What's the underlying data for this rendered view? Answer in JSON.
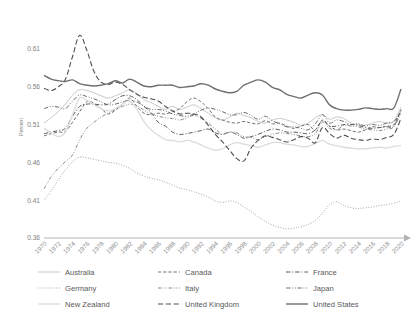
{
  "chart_data": {
    "type": "line",
    "title": "",
    "xlabel": "",
    "ylabel": "Percent",
    "ylim": [
      0.36,
      0.635
    ],
    "xlim": [
      1970,
      2020
    ],
    "grid": false,
    "legend_position": "bottom",
    "yticks": [
      "0.36",
      "0.41",
      "0.46",
      "0.51",
      "0.56",
      "0.61"
    ],
    "ytick_values": [
      0.36,
      0.41,
      0.46,
      0.51,
      0.56,
      0.61
    ],
    "xticks": [
      "1970",
      "1972",
      "1974",
      "1976",
      "1978",
      "1980",
      "1982",
      "1984",
      "1986",
      "1988",
      "1990",
      "1992",
      "1994",
      "1996",
      "1998",
      "2000",
      "2002",
      "2004",
      "2006",
      "2008",
      "2010",
      "2012",
      "2014",
      "2016",
      "2018",
      "2020"
    ],
    "x": [
      1970,
      1971,
      1972,
      1973,
      1974,
      1975,
      1976,
      1977,
      1978,
      1979,
      1980,
      1981,
      1982,
      1983,
      1984,
      1985,
      1986,
      1987,
      1988,
      1989,
      1990,
      1991,
      1992,
      1993,
      1994,
      1995,
      1996,
      1997,
      1998,
      1999,
      2000,
      2001,
      2002,
      2003,
      2004,
      2005,
      2006,
      2007,
      2008,
      2009,
      2010,
      2011,
      2012,
      2013,
      2014,
      2015,
      2016,
      2017,
      2018,
      2019,
      2020
    ],
    "series": [
      {
        "name": "Australia",
        "style": "solid",
        "color": "#c9c9c9",
        "width": 1.0,
        "values": [
          0.512,
          0.519,
          0.527,
          0.537,
          0.549,
          0.556,
          0.555,
          0.552,
          0.548,
          0.545,
          0.548,
          0.552,
          0.556,
          0.551,
          0.543,
          0.539,
          0.534,
          0.53,
          0.534,
          0.53,
          0.533,
          0.536,
          0.531,
          0.525,
          0.519,
          0.516,
          0.52,
          0.525,
          0.522,
          0.519,
          0.514,
          0.512,
          0.516,
          0.518,
          0.516,
          0.513,
          0.509,
          0.512,
          0.519,
          0.523,
          0.517,
          0.52,
          0.518,
          0.512,
          0.51,
          0.509,
          0.512,
          0.514,
          0.512,
          0.515,
          0.533
        ]
      },
      {
        "name": "Canada",
        "style": "dashed",
        "color": "#6e6e6e",
        "width": 1.0,
        "values": [
          0.495,
          0.498,
          0.5,
          0.501,
          0.513,
          0.527,
          0.54,
          0.538,
          0.531,
          0.524,
          0.529,
          0.537,
          0.545,
          0.534,
          0.525,
          0.523,
          0.525,
          0.524,
          0.527,
          0.531,
          0.54,
          0.545,
          0.54,
          0.531,
          0.52,
          0.516,
          0.513,
          0.512,
          0.514,
          0.512,
          0.511,
          0.515,
          0.511,
          0.512,
          0.508,
          0.505,
          0.508,
          0.51,
          0.503,
          0.516,
          0.508,
          0.503,
          0.504,
          0.502,
          0.5,
          0.503,
          0.507,
          0.506,
          0.508,
          0.51,
          0.53
        ]
      },
      {
        "name": "France",
        "style": "dashdot",
        "color": "#5a5a5a",
        "width": 1.0,
        "values": [
          0.498,
          0.5,
          0.502,
          0.505,
          0.521,
          0.534,
          0.537,
          0.537,
          0.536,
          0.537,
          0.543,
          0.548,
          0.548,
          0.543,
          0.534,
          0.526,
          0.513,
          0.508,
          0.5,
          0.497,
          0.498,
          0.5,
          0.502,
          0.504,
          0.499,
          0.497,
          0.5,
          0.497,
          0.492,
          0.494,
          0.497,
          0.501,
          0.504,
          0.503,
          0.5,
          0.5,
          0.499,
          0.498,
          0.503,
          0.515,
          0.508,
          0.508,
          0.51,
          0.51,
          0.509,
          0.506,
          0.505,
          0.506,
          0.507,
          0.508,
          0.529
        ]
      },
      {
        "name": "Germany",
        "style": "dotted",
        "color": "#9e9e9e",
        "width": 1.0,
        "values": [
          0.41,
          0.422,
          0.437,
          0.45,
          0.461,
          0.467,
          0.466,
          0.464,
          0.462,
          0.46,
          0.459,
          0.456,
          0.452,
          0.446,
          0.442,
          0.439,
          0.437,
          0.434,
          0.43,
          0.426,
          0.424,
          0.421,
          0.418,
          0.414,
          0.409,
          0.407,
          0.409,
          0.407,
          0.401,
          0.395,
          0.388,
          0.382,
          0.377,
          0.374,
          0.372,
          0.373,
          0.375,
          0.378,
          0.383,
          0.393,
          0.404,
          0.408,
          0.403,
          0.4,
          0.399,
          0.4,
          0.401,
          0.403,
          0.404,
          0.406,
          0.409
        ]
      },
      {
        "name": "Italy",
        "style": "dashdotdot-light",
        "color": "#8a8a8a",
        "width": 1.0,
        "values": [
          0.425,
          0.441,
          0.452,
          0.461,
          0.47,
          0.49,
          0.505,
          0.513,
          0.52,
          0.525,
          0.53,
          0.534,
          0.537,
          0.535,
          0.529,
          0.524,
          0.521,
          0.519,
          0.518,
          0.516,
          0.519,
          0.522,
          0.518,
          0.512,
          0.504,
          0.497,
          0.5,
          0.499,
          0.494,
          0.493,
          0.49,
          0.494,
          0.497,
          0.499,
          0.498,
          0.497,
          0.495,
          0.494,
          0.498,
          0.513,
          0.505,
          0.503,
          0.509,
          0.508,
          0.507,
          0.504,
          0.503,
          0.502,
          0.504,
          0.507,
          0.525
        ]
      },
      {
        "name": "Japan",
        "style": "dashdotdot",
        "color": "#6b6b6b",
        "width": 1.0,
        "values": [
          0.531,
          0.534,
          0.533,
          0.531,
          0.541,
          0.549,
          0.547,
          0.544,
          0.54,
          0.536,
          0.537,
          0.54,
          0.542,
          0.54,
          0.534,
          0.53,
          0.53,
          0.528,
          0.524,
          0.522,
          0.521,
          0.524,
          0.529,
          0.532,
          0.53,
          0.527,
          0.523,
          0.523,
          0.526,
          0.522,
          0.517,
          0.521,
          0.515,
          0.511,
          0.507,
          0.507,
          0.505,
          0.503,
          0.511,
          0.523,
          0.512,
          0.516,
          0.514,
          0.51,
          0.511,
          0.508,
          0.51,
          0.509,
          0.512,
          0.514,
          0.527
        ]
      },
      {
        "name": "New Zealand",
        "style": "solid",
        "color": "#dcdcdc",
        "width": 1.3,
        "values": [
          0.505,
          0.499,
          0.494,
          0.5,
          0.523,
          0.545,
          0.542,
          0.536,
          0.531,
          0.528,
          0.531,
          0.537,
          0.541,
          0.53,
          0.514,
          0.503,
          0.496,
          0.49,
          0.489,
          0.487,
          0.489,
          0.487,
          0.483,
          0.479,
          0.476,
          0.478,
          0.483,
          0.486,
          0.484,
          0.482,
          0.48,
          0.483,
          0.486,
          0.486,
          0.484,
          0.483,
          0.481,
          0.481,
          0.485,
          0.489,
          0.484,
          0.482,
          0.48,
          0.479,
          0.478,
          0.478,
          0.479,
          0.48,
          0.479,
          0.481,
          0.482
        ]
      },
      {
        "name": "United Kingdom",
        "style": "longdash",
        "color": "#4f4f4f",
        "width": 1.1,
        "values": [
          0.558,
          0.555,
          0.56,
          0.57,
          0.6,
          0.628,
          0.608,
          0.58,
          0.566,
          0.563,
          0.566,
          0.563,
          0.556,
          0.55,
          0.546,
          0.544,
          0.541,
          0.534,
          0.528,
          0.524,
          0.525,
          0.524,
          0.52,
          0.509,
          0.497,
          0.487,
          0.476,
          0.465,
          0.462,
          0.479,
          0.489,
          0.495,
          0.493,
          0.49,
          0.487,
          0.49,
          0.494,
          0.492,
          0.486,
          0.506,
          0.498,
          0.492,
          0.496,
          0.492,
          0.49,
          0.489,
          0.491,
          0.49,
          0.493,
          0.497,
          0.518
        ]
      },
      {
        "name": "United States",
        "style": "solid",
        "color": "#6f6f6f",
        "width": 1.4,
        "values": [
          0.575,
          0.57,
          0.568,
          0.567,
          0.569,
          0.564,
          0.562,
          0.561,
          0.562,
          0.564,
          0.568,
          0.565,
          0.57,
          0.566,
          0.561,
          0.56,
          0.562,
          0.562,
          0.562,
          0.559,
          0.56,
          0.561,
          0.564,
          0.562,
          0.557,
          0.554,
          0.552,
          0.554,
          0.562,
          0.566,
          0.569,
          0.566,
          0.559,
          0.556,
          0.55,
          0.547,
          0.545,
          0.549,
          0.552,
          0.549,
          0.536,
          0.531,
          0.529,
          0.529,
          0.53,
          0.532,
          0.531,
          0.53,
          0.531,
          0.532,
          0.557
        ]
      }
    ]
  },
  "legend": {
    "items": [
      {
        "label": "Australia",
        "series": "Australia"
      },
      {
        "label": "Canada",
        "series": "Canada"
      },
      {
        "label": "France",
        "series": "France"
      },
      {
        "label": "Germany",
        "series": "Germany"
      },
      {
        "label": "Italy",
        "series": "Italy"
      },
      {
        "label": "Japan",
        "series": "Japan"
      },
      {
        "label": "New Zealand",
        "series": "New Zealand"
      },
      {
        "label": "United Kingdom",
        "series": "United Kingdom"
      },
      {
        "label": "United States",
        "series": "United States"
      }
    ]
  },
  "axis": {
    "y_title": "Percent",
    "x_arrow": true
  }
}
